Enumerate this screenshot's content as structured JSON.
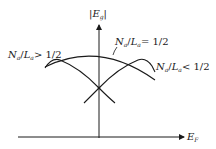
{
  "diagram": {
    "axes": {
      "y_label": {
        "prefix": "|",
        "main": "E",
        "sub": "g",
        "suffix": "|"
      },
      "x_label": {
        "main": "E",
        "sub": "F"
      }
    },
    "curves": [
      {
        "id": "equal",
        "label": {
          "n": "N",
          "n_sub": "a",
          "l": "L",
          "l_sub": "a",
          "rel": "= 1/2"
        }
      },
      {
        "id": "greater",
        "label": {
          "n": "N",
          "n_sub": "a",
          "l": "L",
          "l_sub": "a",
          "rel": "> 1/2"
        }
      },
      {
        "id": "less",
        "label": {
          "n": "N",
          "n_sub": "a",
          "l": "L",
          "l_sub": "a",
          "rel": "< 1/2"
        }
      }
    ],
    "colors": {
      "line": "#1a1a1a",
      "background": "#ffffff"
    }
  }
}
